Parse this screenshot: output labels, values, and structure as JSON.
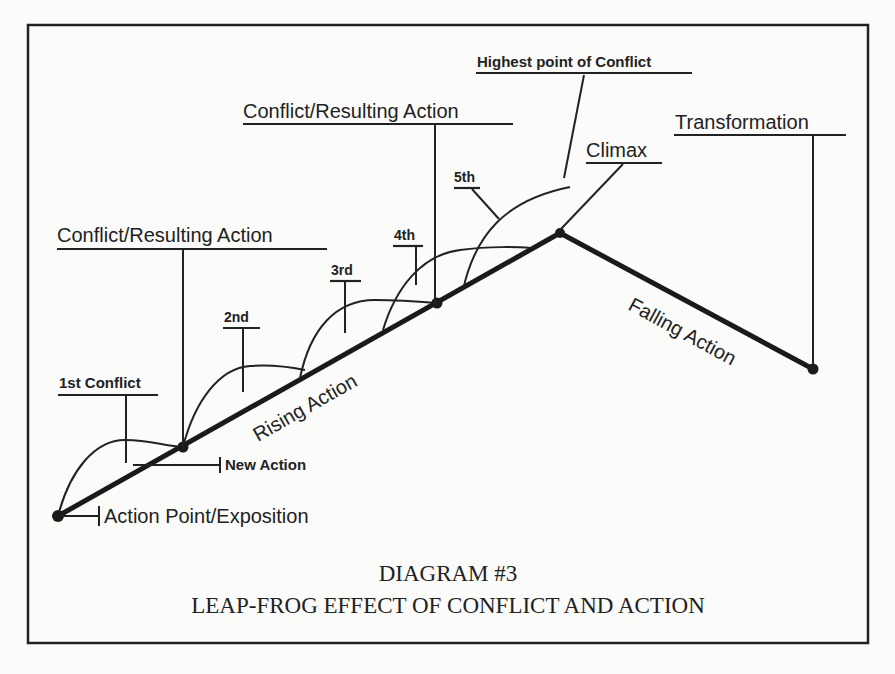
{
  "diagram": {
    "labels": {
      "conflict_resulting_action_upper": "Conflict/Resulting Action",
      "highest_point": "Highest point of Conflict",
      "transformation": "Transformation",
      "climax": "Climax",
      "fifth": "5th",
      "fourth": "4th",
      "third": "3rd",
      "second": "2nd",
      "conflict_resulting_action_lower": "Conflict/Resulting Action",
      "first_conflict": "1st Conflict",
      "new_action": "New Action",
      "action_point": "Action Point/Exposition",
      "rising_action": "Rising Action",
      "falling_action": "Falling Action"
    },
    "caption": {
      "line1": "DIAGRAM #3",
      "line2": "LEAP-FROG EFFECT OF CONFLICT AND ACTION"
    }
  }
}
